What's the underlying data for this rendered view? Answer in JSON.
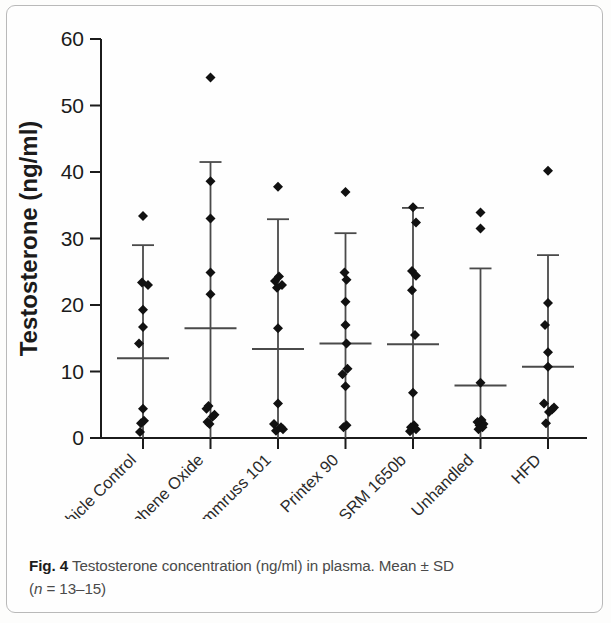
{
  "figure": {
    "caption_label": "Fig. 4",
    "caption_text": "Testosterone concentration (ng/ml) in plasma. Mean ± SD",
    "caption_line2_pre": "(",
    "caption_line2_italic": "n",
    "caption_line2_post": " = 13–15)"
  },
  "chart_data": {
    "type": "scatter",
    "title": "",
    "xlabel": "",
    "ylabel": "Testosterone (ng/ml)",
    "ylim": [
      0,
      60
    ],
    "yticks": [
      0,
      10,
      20,
      30,
      40,
      50,
      60
    ],
    "ytick_labels": [
      "0",
      "10",
      "20",
      "30",
      "40",
      "50",
      "60"
    ],
    "grid": false,
    "legend": "none",
    "marker": "diamond",
    "marker_color": "#111111",
    "errorbar_color": "#4a4a4a",
    "error_type": "Mean ± SD",
    "categories": [
      "Vehicle Control",
      "Graphene Oxide",
      "Flammruss 101",
      "Printex 90",
      "SRM 1650b",
      "Unhandled",
      "HFD"
    ],
    "groups": [
      {
        "name": "Vehicle Control",
        "mean": 12.0,
        "sd_upper": 29.0,
        "sd_lower": 0.0,
        "points": [
          33.4,
          23.4,
          23.0,
          19.3,
          16.7,
          14.2,
          4.4,
          2.6,
          2.2,
          0.9
        ]
      },
      {
        "name": "Graphene Oxide",
        "mean": 16.5,
        "sd_upper": 41.5,
        "sd_lower": 0.0,
        "points": [
          54.2,
          38.6,
          33.0,
          24.9,
          21.6,
          4.8,
          4.4,
          3.5,
          3.2,
          2.4,
          2.1
        ]
      },
      {
        "name": "Flammruss 101",
        "mean": 13.4,
        "sd_upper": 32.9,
        "sd_lower": 0.0,
        "points": [
          37.8,
          24.3,
          23.6,
          23.0,
          22.6,
          16.5,
          5.2,
          2.1,
          1.6,
          1.3,
          1.1
        ]
      },
      {
        "name": "Printex 90",
        "mean": 14.2,
        "sd_upper": 30.8,
        "sd_lower": 0.0,
        "points": [
          37.0,
          24.9,
          23.8,
          20.5,
          17.0,
          14.2,
          10.4,
          9.6,
          7.8,
          1.9,
          1.6
        ]
      },
      {
        "name": "SRM 1650b",
        "mean": 14.1,
        "sd_upper": 34.6,
        "sd_lower": 0.0,
        "points": [
          34.7,
          32.4,
          25.1,
          24.4,
          22.2,
          15.5,
          6.8,
          1.9,
          1.6,
          1.3,
          1.0
        ]
      },
      {
        "name": "Unhandled",
        "mean": 7.9,
        "sd_upper": 25.5,
        "sd_lower": 0.0,
        "points": [
          33.9,
          31.5,
          8.3,
          2.7,
          2.4,
          2.1,
          1.9,
          1.6,
          1.3
        ]
      },
      {
        "name": "HFD",
        "mean": 10.7,
        "sd_upper": 27.5,
        "sd_lower": 0.0,
        "points": [
          40.2,
          20.3,
          17.0,
          12.9,
          10.7,
          5.2,
          4.6,
          4.3,
          3.9,
          2.2
        ]
      }
    ],
    "point_jitter": {
      "Vehicle Control": [
        0,
        -1,
        5,
        0,
        0,
        -4,
        0,
        1,
        -2,
        -3
      ],
      "Graphene Oxide": [
        0,
        0,
        0,
        0,
        0,
        -2,
        -4,
        4,
        2,
        -3,
        -1
      ],
      "Flammruss 101": [
        0,
        1,
        -3,
        4,
        -1,
        0,
        0,
        -4,
        3,
        5,
        -2
      ],
      "Printex 90": [
        0,
        -1,
        1,
        0,
        0,
        1,
        2,
        -3,
        0,
        1,
        -2
      ],
      "SRM 1650b": [
        0,
        3,
        -1,
        3,
        -1,
        2,
        0,
        1,
        -2,
        3,
        -3
      ],
      "Unhandled": [
        0,
        0,
        0,
        1,
        -3,
        3,
        -1,
        2,
        -2
      ],
      "HFD": [
        0,
        0,
        -3,
        0,
        0,
        -4,
        6,
        4,
        1,
        -2
      ]
    }
  }
}
